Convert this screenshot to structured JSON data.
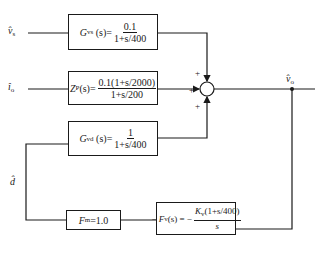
{
  "diagram": {
    "type": "block-diagram",
    "inputs": [
      {
        "id": "vs",
        "symbol": "v̂",
        "subscript": "s"
      },
      {
        "id": "io",
        "symbol": "î",
        "subscript": "o"
      }
    ],
    "output": {
      "symbol": "v̂",
      "subscript": "o"
    },
    "feedback_signal": {
      "symbol": "d̂"
    },
    "blocks": {
      "gvs": {
        "name": "G",
        "subscript": "vs",
        "arg": "(s)=",
        "numerator": "0.1",
        "denominator": "1+s/400"
      },
      "zp": {
        "name": "Z",
        "subscript": "P",
        "arg": "(s)=",
        "numerator": "0.1(1+s/2000)",
        "denominator": "1+s/200"
      },
      "gvd": {
        "name": "G",
        "subscript": "vd",
        "arg": "(s)=",
        "numerator": "1",
        "denominator": "1+s/400"
      },
      "fm": {
        "name": "F",
        "subscript": "m",
        "value": "=1.0"
      },
      "fv": {
        "prefix": "−",
        "name": "F",
        "subscript": "v",
        "arg": "(s) = −",
        "numerator_k": "K",
        "numerator_k_sub": "v",
        "numerator_rest": "(1+s/400)",
        "denominator": "s"
      }
    },
    "summing_junction": {
      "signs": [
        "+",
        "+",
        "+"
      ]
    }
  }
}
